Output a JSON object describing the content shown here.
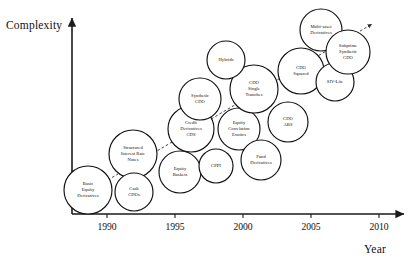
{
  "chart_data": {
    "type": "scatter",
    "title": "",
    "xlabel": "Year",
    "ylabel": "Complexity",
    "xlim": [
      1987.5,
      2010.8
    ],
    "ylim": [
      0,
      100
    ],
    "grid": false,
    "legend": "none",
    "xticks": [
      "1990",
      "1995",
      "2000",
      "2005",
      "2010"
    ],
    "xtick_values": [
      1990,
      1995,
      2000,
      2005,
      2010
    ],
    "yticks": [],
    "annotation": "Dashed upward trend arrow from lower-left to upper-right indicating increasing complexity over time",
    "bubbles": [
      {
        "label": "Basic\nEquity\nDerivatives",
        "x": 1989.6,
        "y": 8,
        "r": 24,
        "cx": 88,
        "cy": 190
      },
      {
        "label": "Structured\nInterest Rate\nNotes",
        "x": 1992.0,
        "y": 28,
        "r": 24,
        "cx": 133,
        "cy": 154
      },
      {
        "label": "Cash\nCDOs",
        "x": 1993.6,
        "y": 11,
        "r": 19,
        "cx": 134,
        "cy": 192
      },
      {
        "label": "Equity\nBaskets",
        "x": 1995.2,
        "y": 20,
        "r": 21,
        "cx": 180,
        "cy": 172
      },
      {
        "label": "Credit\nDerivatives\nCDS",
        "x": 1995.6,
        "y": 41,
        "r": 23,
        "cx": 191,
        "cy": 129
      },
      {
        "label": "Synthetic\nCDO",
        "x": 1996.4,
        "y": 56,
        "r": 21,
        "cx": 200,
        "cy": 99
      },
      {
        "label": "CPPI",
        "x": 1997.6,
        "y": 18,
        "r": 17,
        "cx": 216,
        "cy": 166
      },
      {
        "label": "Equity\nCorrelation\nExotics",
        "x": 1999.0,
        "y": 38,
        "r": 21,
        "cx": 239,
        "cy": 129
      },
      {
        "label": "CDO\nSingle\nTranches",
        "x": 2000.0,
        "y": 58,
        "r": 24,
        "cx": 254,
        "cy": 89
      },
      {
        "label": "Fund\nDerivatives",
        "x": 2000.0,
        "y": 22,
        "r": 20,
        "cx": 261,
        "cy": 160
      },
      {
        "label": "Hybrids",
        "x": 2000.4,
        "y": 74,
        "r": 19,
        "cx": 226,
        "cy": 60
      },
      {
        "label": "CDO\nABS",
        "x": 2002.0,
        "y": 40,
        "r": 20,
        "cx": 288,
        "cy": 122
      },
      {
        "label": "CDO\nSquared",
        "x": 2003.6,
        "y": 65,
        "r": 23,
        "cx": 301,
        "cy": 71
      },
      {
        "label": "SIV-Lite",
        "x": 2005.6,
        "y": 58,
        "r": 19,
        "cx": 335,
        "cy": 82
      },
      {
        "label": "Multi-asset\nDerivatives",
        "x": 2005.8,
        "y": 88,
        "r": 21,
        "cx": 321,
        "cy": 30
      },
      {
        "label": "Subprime\nSynthetic\nCDO",
        "x": 2007.0,
        "y": 76,
        "r": 22,
        "cx": 348,
        "cy": 52
      }
    ]
  }
}
